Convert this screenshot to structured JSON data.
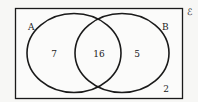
{
  "diagram": {
    "type": "venn",
    "universal_symbol": "ℰ",
    "sets": [
      {
        "label": "A"
      },
      {
        "label": "B"
      }
    ],
    "regions": {
      "a_only": "7",
      "a_and_b": "16",
      "b_only": "5",
      "neither": "2"
    },
    "colors": {
      "stroke": "#1a1a1a",
      "background": "#f7f7f5",
      "text": "#222222"
    }
  }
}
